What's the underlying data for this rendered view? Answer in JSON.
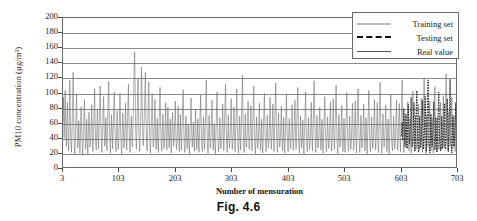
{
  "figure": {
    "caption": "Fig. 4.6"
  },
  "chart_data": {
    "type": "line",
    "title": "",
    "xlabel": "Number of mensuration",
    "ylabel": "PM10 concentration (µg/m³)",
    "xlim": [
      3,
      703
    ],
    "ylim": [
      0,
      200
    ],
    "grid": true,
    "legend_position": "top-right",
    "xticks": [
      3,
      103,
      203,
      303,
      403,
      503,
      603,
      703
    ],
    "yticks": [
      0,
      20,
      40,
      60,
      80,
      100,
      120,
      140,
      160,
      180,
      200
    ],
    "legend": [
      {
        "name": "Training set",
        "color": "#bdbdbd",
        "style": "solid"
      },
      {
        "name": "Testing set",
        "color": "#111111",
        "style": "dashed"
      },
      {
        "name": "Real value",
        "color": "#5a5a5a",
        "style": "solid"
      }
    ],
    "series": [
      {
        "name": "Real value",
        "color": "#6a6a6a",
        "style": "solid",
        "x_start": 3,
        "x_step": 1,
        "values": [
          62,
          95,
          41,
          76,
          104,
          52,
          30,
          67,
          88,
          45,
          24,
          58,
          118,
          72,
          38,
          22,
          49,
          86,
          128,
          61,
          33,
          19,
          44,
          70,
          99,
          55,
          28,
          40,
          64,
          36,
          21,
          47,
          82,
          57,
          31,
          18,
          43,
          69,
          92,
          50,
          26,
          39,
          66,
          34,
          20,
          46,
          75,
          53,
          29,
          37,
          60,
          85,
          42,
          23,
          48,
          71,
          106,
          58,
          32,
          25,
          51,
          79,
          44,
          27,
          54,
          89,
          110,
          63,
          35,
          22,
          47,
          73,
          96,
          52,
          30,
          41,
          68,
          38,
          24,
          56,
          91,
          116,
          66,
          36,
          21,
          45,
          72,
          48,
          27,
          59,
          83,
          102,
          54,
          31,
          23,
          50,
          77,
          43,
          26,
          40,
          65,
          100,
          57,
          33,
          20,
          46,
          74,
          49,
          28,
          38,
          62,
          87,
          44,
          25,
          52,
          81,
          112,
          60,
          34,
          22,
          47,
          70,
          42,
          29,
          55,
          90,
          132,
          155,
          98,
          44,
          26,
          51,
          86,
          120,
          68,
          35,
          23,
          49,
          76,
          135,
          104,
          58,
          31,
          42,
          69,
          97,
          128,
          73,
          39,
          24,
          47,
          80,
          115,
          64,
          33,
          21,
          45,
          71,
          100,
          55,
          29,
          38,
          63,
          92,
          48,
          26,
          40,
          67,
          36,
          22,
          50,
          78,
          108,
          59,
          32,
          24,
          46,
          73,
          44,
          27,
          37,
          61,
          88,
          43,
          25,
          53,
          82,
          46,
          28,
          39,
          66,
          35,
          21,
          48,
          75,
          51,
          30,
          41,
          64,
          90,
          47,
          26,
          36,
          58,
          83,
          44,
          23,
          49,
          72,
          40,
          25,
          55,
          86,
          105,
          57,
          31,
          22,
          46,
          70,
          42,
          27,
          38,
          60,
          33,
          20,
          44,
          68,
          94,
          50,
          29,
          37,
          62,
          35,
          24,
          52,
          79,
          45,
          26,
          41,
          66,
          36,
          22,
          48,
          74,
          98,
          54,
          30,
          23,
          45,
          69,
          40,
          26,
          56,
          84,
          118,
          63,
          34,
          21,
          47,
          71,
          43,
          28,
          38,
          65,
          91,
          49,
          25,
          39,
          60,
          33,
          20,
          46,
          77,
          102,
          55,
          31,
          23,
          44,
          68,
          41,
          27,
          37,
          58,
          86,
          45,
          24,
          50,
          80,
          112,
          61,
          34,
          22,
          47,
          72,
          42,
          28,
          39,
          64,
          93,
          48,
          26,
          36,
          57,
          82,
          44,
          23,
          49,
          75,
          106,
          59,
          32,
          21,
          45,
          70,
          40,
          25,
          54,
          88,
          124,
          67,
          35,
          22,
          46,
          73,
          43,
          29,
          38,
          62,
          90,
          47,
          26,
          37,
          59,
          84,
          45,
          24,
          51,
          78,
          110,
          58,
          31,
          20,
          44,
          69,
          41,
          27,
          36,
          61,
          87,
          46,
          25,
          40,
          66,
          34,
          21,
          48,
          76,
          100,
          53,
          30,
          23,
          45,
          71,
          42,
          28,
          38,
          63,
          95,
          49,
          26,
          39,
          60,
          86,
          44,
          23,
          50,
          81,
          114,
          62,
          33,
          22,
          47,
          74,
          43,
          29,
          37,
          58,
          83,
          45,
          24,
          41,
          68,
          35,
          21,
          46,
          72,
          99,
          52,
          30,
          23,
          44,
          67,
          40,
          27,
          36,
          59,
          85,
          47,
          25,
          38,
          63,
          91,
          48,
          26,
          51,
          79,
          108,
          56,
          32,
          21,
          45,
          70,
          42,
          28,
          39,
          65,
          33,
          20,
          46,
          75,
          102,
          54,
          31,
          23,
          43,
          68,
          41,
          26,
          37,
          60,
          88,
          45,
          24,
          49,
          77,
          117,
          64,
          34,
          22,
          47,
          71,
          40,
          28,
          36,
          57,
          82,
          44,
          25,
          39,
          66,
          35,
          21,
          48,
          73,
          96,
          51,
          29,
          23,
          45,
          69,
          42,
          27,
          38,
          61,
          89,
          46,
          24,
          40,
          64,
          93,
          47,
          26,
          50,
          80,
          111,
          59,
          32,
          20,
          44,
          72,
          43,
          29,
          37,
          58,
          84,
          45,
          23,
          41,
          67,
          34,
          22,
          46,
          74,
          101,
          55,
          30,
          24,
          43,
          70,
          40,
          26,
          36,
          62,
          87,
          48,
          25,
          39,
          65,
          90,
          44,
          21,
          49,
          78,
          106,
          57,
          33,
          22,
          45,
          71,
          42,
          28,
          38,
          60,
          86,
          46,
          24,
          40,
          68,
          35,
          20,
          47,
          76,
          104,
          53,
          31,
          23,
          44,
          69,
          41,
          27,
          37,
          63,
          92,
          47,
          25,
          39,
          61,
          88,
          45,
          22,
          50,
          82,
          115,
          60,
          34,
          21,
          46,
          73,
          43,
          29,
          36,
          59,
          85,
          44,
          23,
          42,
          66,
          35,
          20,
          48,
          75,
          98,
          52,
          30,
          24,
          45,
          70,
          40,
          26,
          38,
          64,
          91,
          49,
          25,
          41,
          62,
          87,
          46,
          23,
          51,
          83,
          118,
          65,
          35,
          22,
          47,
          74,
          44,
          28,
          37,
          60,
          89,
          45,
          24,
          40,
          67,
          34,
          21,
          49,
          77,
          103,
          56,
          32,
          23,
          44,
          71,
          42,
          27,
          36,
          58,
          86,
          47,
          25,
          39,
          63,
          94,
          48,
          22,
          52,
          84,
          120,
          63,
          33,
          20,
          45,
          72,
          41,
          29,
          38,
          61,
          90,
          46,
          24,
          42,
          68,
          36,
          21,
          50,
          79,
          109,
          58,
          31,
          23,
          43,
          69,
          40,
          26,
          37,
          62,
          88,
          48,
          25,
          41,
          65,
          97,
          50,
          28,
          55,
          86,
          126,
          70,
          38,
          24,
          48,
          76,
          46,
          30,
          40,
          64,
          95,
          52,
          27,
          44,
          70,
          38,
          23,
          53,
          82,
          112,
          62,
          34,
          25,
          47,
          73,
          45,
          31,
          41,
          67,
          92,
          50,
          26,
          43,
          69,
          100,
          54,
          29,
          58,
          88,
          96,
          60
        ]
      },
      {
        "name": "Testing set",
        "color": "#111111",
        "style": "dashed",
        "x_start": 603,
        "x_step": 1,
        "values": [
          44,
          62,
          38,
          55,
          80,
          46,
          30,
          50,
          72,
          41,
          27,
          58,
          86,
          48,
          33,
          42,
          66,
          95,
          52,
          29,
          37,
          60,
          88,
          45,
          24,
          51,
          78,
          104,
          57,
          32,
          22,
          46,
          70,
          43,
          28,
          38,
          63,
          91,
          49,
          26,
          40,
          64,
          96,
          47,
          23,
          53,
          85,
          118,
          64,
          34,
          21,
          45,
          73,
          42,
          29,
          39,
          61,
          89,
          46,
          25,
          41,
          68,
          35,
          22,
          48,
          76,
          102,
          55,
          31,
          24,
          44,
          70,
          41,
          27,
          37,
          59,
          87,
          47,
          26,
          40,
          63,
          93,
          49,
          23,
          52,
          83,
          119,
          62,
          33,
          21,
          46,
          71,
          42,
          30,
          38,
          60,
          88,
          45,
          24,
          43,
          69,
          99,
          58,
          92,
          60
        ]
      }
    ]
  }
}
